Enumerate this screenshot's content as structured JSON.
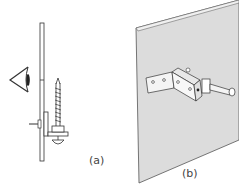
{
  "figure": {
    "panels": [
      {
        "id": "a",
        "label": "(a)",
        "description": "Side view: eye looking at a panel with a wood screw and bracket behind it"
      },
      {
        "id": "b",
        "label": "(b)",
        "description": "Perspective view: panel with Z-shaped angle bracket and bolt"
      }
    ]
  },
  "colors": {
    "line": "#333333",
    "panel_fill": "#dcdcdc",
    "panel_edge": "#555555"
  }
}
